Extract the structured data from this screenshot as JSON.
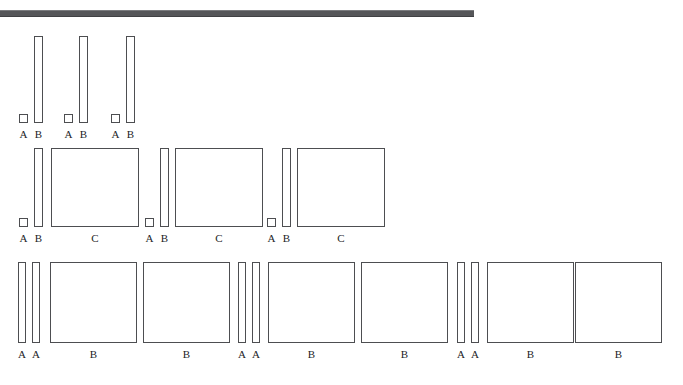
{
  "figure": {
    "background_color": "#ffffff",
    "stroke_color": "#4d4e51",
    "fill_color": "#ffffff",
    "label_color": "#232427",
    "top_bar": {
      "name": "header-rule",
      "color": "#555659",
      "x": 0,
      "y": 10,
      "width": 474,
      "height": 7
    },
    "rows": [
      {
        "id": "row-1",
        "label_baseline_y": 128,
        "groups": [
          {
            "id": "row1-group1",
            "shapes": [
              {
                "label": "A",
                "x": 19,
                "y": 114,
                "width": 9,
                "height": 9
              },
              {
                "label": "B",
                "x": 34,
                "y": 36,
                "width": 9,
                "height": 87
              }
            ]
          },
          {
            "id": "row1-group2",
            "shapes": [
              {
                "label": "A",
                "x": 64,
                "y": 114,
                "width": 9,
                "height": 9
              },
              {
                "label": "B",
                "x": 79,
                "y": 36,
                "width": 9,
                "height": 87
              }
            ]
          },
          {
            "id": "row1-group3",
            "shapes": [
              {
                "label": "A",
                "x": 111,
                "y": 114,
                "width": 9,
                "height": 9
              },
              {
                "label": "B",
                "x": 126,
                "y": 36,
                "width": 9,
                "height": 87
              }
            ]
          }
        ]
      },
      {
        "id": "row-2",
        "label_baseline_y": 232,
        "groups": [
          {
            "id": "row2-group1",
            "shapes": [
              {
                "label": "A",
                "x": 19,
                "y": 218,
                "width": 9,
                "height": 9
              },
              {
                "label": "B",
                "x": 34,
                "y": 148,
                "width": 9,
                "height": 79
              },
              {
                "label": "C",
                "x": 51,
                "y": 148,
                "width": 88,
                "height": 79
              }
            ]
          },
          {
            "id": "row2-group2",
            "shapes": [
              {
                "label": "A",
                "x": 145,
                "y": 218,
                "width": 9,
                "height": 9
              },
              {
                "label": "B",
                "x": 160,
                "y": 148,
                "width": 9,
                "height": 79
              },
              {
                "label": "C",
                "x": 175,
                "y": 148,
                "width": 88,
                "height": 79
              }
            ]
          },
          {
            "id": "row2-group3",
            "shapes": [
              {
                "label": "A",
                "x": 267,
                "y": 218,
                "width": 9,
                "height": 9
              },
              {
                "label": "B",
                "x": 282,
                "y": 148,
                "width": 9,
                "height": 79
              },
              {
                "label": "C",
                "x": 297,
                "y": 148,
                "width": 88,
                "height": 79
              }
            ]
          }
        ]
      },
      {
        "id": "row-3",
        "label_baseline_y": 348,
        "groups": [
          {
            "id": "row3-group1",
            "shapes": [
              {
                "label": "A",
                "x": 18,
                "y": 262,
                "width": 8,
                "height": 81
              },
              {
                "label": "A",
                "x": 32,
                "y": 262,
                "width": 8,
                "height": 81
              },
              {
                "label": "B",
                "x": 50,
                "y": 262,
                "width": 87,
                "height": 81
              }
            ]
          },
          {
            "id": "row3-group2",
            "shapes": [
              {
                "label": "B",
                "x": 143,
                "y": 262,
                "width": 87,
                "height": 81
              }
            ]
          },
          {
            "id": "row3-group3",
            "shapes": [
              {
                "label": "A",
                "x": 238,
                "y": 262,
                "width": 8,
                "height": 81
              },
              {
                "label": "A",
                "x": 252,
                "y": 262,
                "width": 8,
                "height": 81
              },
              {
                "label": "B",
                "x": 268,
                "y": 262,
                "width": 87,
                "height": 81
              }
            ]
          },
          {
            "id": "row3-group4",
            "shapes": [
              {
                "label": "B",
                "x": 361,
                "y": 262,
                "width": 87,
                "height": 81
              }
            ]
          },
          {
            "id": "row3-group5",
            "shapes": [
              {
                "label": "A",
                "x": 457,
                "y": 262,
                "width": 8,
                "height": 81
              },
              {
                "label": "A",
                "x": 471,
                "y": 262,
                "width": 8,
                "height": 81
              },
              {
                "label": "B",
                "x": 487,
                "y": 262,
                "width": 87,
                "height": 81
              }
            ]
          },
          {
            "id": "row3-group6",
            "shapes": [
              {
                "label": "B",
                "x": 575,
                "y": 262,
                "width": 87,
                "height": 81
              }
            ]
          }
        ]
      }
    ]
  }
}
